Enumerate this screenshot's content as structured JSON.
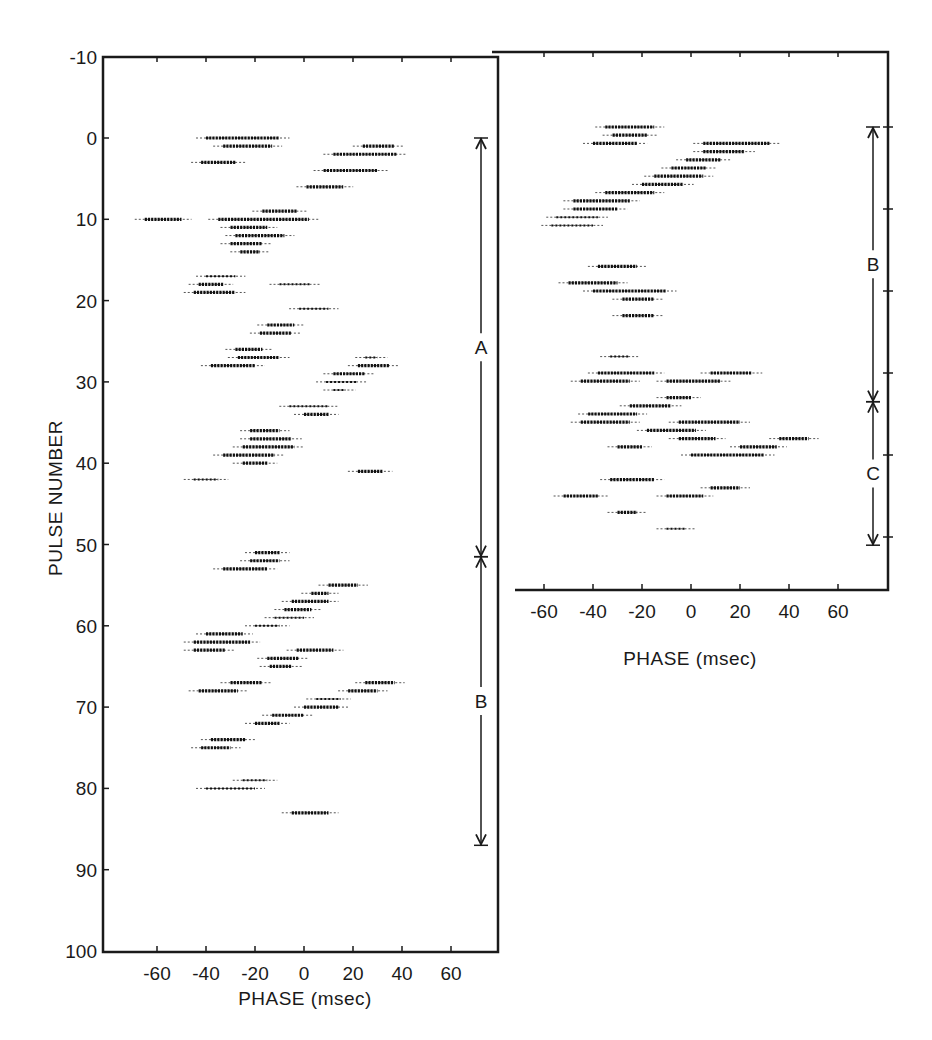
{
  "figure": {
    "left_panel": {
      "ylabel": "PULSE NUMBER",
      "xlabel": "PHASE (msec)",
      "y_ticks": [
        "-10",
        "0",
        "10",
        "20",
        "30",
        "40",
        "50",
        "60",
        "70",
        "80",
        "90",
        "100"
      ],
      "x_ticks": [
        "-60",
        "-40",
        "-20",
        "0",
        "20",
        "40",
        "60"
      ],
      "segments": [
        {
          "label": "A",
          "from": 0,
          "to": 51.5
        },
        {
          "label": "B",
          "from": 51.5,
          "to": 87
        }
      ]
    },
    "right_panel": {
      "xlabel": "PHASE (msec)",
      "x_ticks": [
        "-60",
        "-40",
        "-20",
        "0",
        "20",
        "40",
        "60"
      ],
      "segments": [
        {
          "label": "B",
          "from": 0,
          "to": 33.5
        },
        {
          "label": "C",
          "from": 33.5,
          "to": 51
        }
      ]
    }
  },
  "chart_data": [
    {
      "type": "scatter",
      "title": "",
      "xlabel": "PHASE (msec)",
      "ylabel": "PULSE NUMBER",
      "xlim": [
        -78,
        80
      ],
      "ylim": [
        100,
        -10
      ],
      "grid": false,
      "description": "Pulse-stack character plot showing drifting subpulse bands; each row is a pulse, dark runs mark emission intensity",
      "segments": [
        {
          "label": "A",
          "start": 0,
          "end": 51.5
        },
        {
          "label": "B",
          "start": 51.5,
          "end": 87
        }
      ],
      "bands": [
        {
          "pulse": 0,
          "x_start": -40,
          "x_end": -10,
          "intensity": "strong"
        },
        {
          "pulse": 1,
          "x_start": -33,
          "x_end": -13,
          "intensity": "strong"
        },
        {
          "pulse": 1,
          "x_start": 24,
          "x_end": 37,
          "intensity": "strong"
        },
        {
          "pulse": 2,
          "x_start": 12,
          "x_end": 38,
          "intensity": "strong"
        },
        {
          "pulse": 3,
          "x_start": -42,
          "x_end": -28,
          "intensity": "strong"
        },
        {
          "pulse": 4,
          "x_start": 8,
          "x_end": 30,
          "intensity": "strong"
        },
        {
          "pulse": 6,
          "x_start": 1,
          "x_end": 16,
          "intensity": "strong"
        },
        {
          "pulse": 9,
          "x_start": -17,
          "x_end": -3,
          "intensity": "strong"
        },
        {
          "pulse": 10,
          "x_start": -65,
          "x_end": -50,
          "intensity": "strong"
        },
        {
          "pulse": 10,
          "x_start": -35,
          "x_end": 2,
          "intensity": "strong"
        },
        {
          "pulse": 11,
          "x_start": -30,
          "x_end": -15,
          "intensity": "strong"
        },
        {
          "pulse": 12,
          "x_start": -28,
          "x_end": -8,
          "intensity": "strong"
        },
        {
          "pulse": 13,
          "x_start": -30,
          "x_end": -17,
          "intensity": "strong"
        },
        {
          "pulse": 14,
          "x_start": -26,
          "x_end": -18,
          "intensity": "strong"
        },
        {
          "pulse": 17,
          "x_start": -40,
          "x_end": -28,
          "intensity": "medium"
        },
        {
          "pulse": 18,
          "x_start": -43,
          "x_end": -33,
          "intensity": "strong"
        },
        {
          "pulse": 18,
          "x_start": -10,
          "x_end": 3,
          "intensity": "medium"
        },
        {
          "pulse": 19,
          "x_start": -45,
          "x_end": -28,
          "intensity": "strong"
        },
        {
          "pulse": 21,
          "x_start": -2,
          "x_end": 10,
          "intensity": "medium"
        },
        {
          "pulse": 23,
          "x_start": -15,
          "x_end": -4,
          "intensity": "strong"
        },
        {
          "pulse": 24,
          "x_start": -18,
          "x_end": -5,
          "intensity": "strong"
        },
        {
          "pulse": 26,
          "x_start": -28,
          "x_end": -17,
          "intensity": "strong"
        },
        {
          "pulse": 27,
          "x_start": -27,
          "x_end": -10,
          "intensity": "strong"
        },
        {
          "pulse": 27,
          "x_start": 25,
          "x_end": 30,
          "intensity": "medium"
        },
        {
          "pulse": 28,
          "x_start": -38,
          "x_end": -20,
          "intensity": "strong"
        },
        {
          "pulse": 28,
          "x_start": 22,
          "x_end": 35,
          "intensity": "strong"
        },
        {
          "pulse": 29,
          "x_start": 12,
          "x_end": 25,
          "intensity": "strong"
        },
        {
          "pulse": 30,
          "x_start": 9,
          "x_end": 22,
          "intensity": "medium"
        },
        {
          "pulse": 31,
          "x_start": 12,
          "x_end": 17,
          "intensity": "medium"
        },
        {
          "pulse": 33,
          "x_start": -6,
          "x_end": 10,
          "intensity": "medium"
        },
        {
          "pulse": 34,
          "x_start": 0,
          "x_end": 10,
          "intensity": "strong"
        },
        {
          "pulse": 36,
          "x_start": -22,
          "x_end": -10,
          "intensity": "strong"
        },
        {
          "pulse": 37,
          "x_start": -22,
          "x_end": -5,
          "intensity": "strong"
        },
        {
          "pulse": 38,
          "x_start": -25,
          "x_end": -4,
          "intensity": "strong"
        },
        {
          "pulse": 39,
          "x_start": -33,
          "x_end": -12,
          "intensity": "strong"
        },
        {
          "pulse": 40,
          "x_start": -25,
          "x_end": -15,
          "intensity": "strong"
        },
        {
          "pulse": 41,
          "x_start": 22,
          "x_end": 32,
          "intensity": "strong"
        },
        {
          "pulse": 42,
          "x_start": -45,
          "x_end": -35,
          "intensity": "medium"
        },
        {
          "pulse": 51,
          "x_start": -20,
          "x_end": -10,
          "intensity": "strong"
        },
        {
          "pulse": 52,
          "x_start": -22,
          "x_end": -10,
          "intensity": "strong"
        },
        {
          "pulse": 53,
          "x_start": -33,
          "x_end": -15,
          "intensity": "strong"
        },
        {
          "pulse": 55,
          "x_start": 10,
          "x_end": 22,
          "intensity": "strong"
        },
        {
          "pulse": 56,
          "x_start": 3,
          "x_end": 10,
          "intensity": "strong"
        },
        {
          "pulse": 57,
          "x_start": -5,
          "x_end": 10,
          "intensity": "strong"
        },
        {
          "pulse": 58,
          "x_start": -8,
          "x_end": 3,
          "intensity": "strong"
        },
        {
          "pulse": 59,
          "x_start": -12,
          "x_end": 0,
          "intensity": "medium"
        },
        {
          "pulse": 60,
          "x_start": -20,
          "x_end": -10,
          "intensity": "medium"
        },
        {
          "pulse": 61,
          "x_start": -40,
          "x_end": -25,
          "intensity": "strong"
        },
        {
          "pulse": 62,
          "x_start": -45,
          "x_end": -22,
          "intensity": "strong"
        },
        {
          "pulse": 63,
          "x_start": -45,
          "x_end": -32,
          "intensity": "strong"
        },
        {
          "pulse": 63,
          "x_start": -3,
          "x_end": 12,
          "intensity": "strong"
        },
        {
          "pulse": 64,
          "x_start": -15,
          "x_end": -2,
          "intensity": "strong"
        },
        {
          "pulse": 65,
          "x_start": -14,
          "x_end": -5,
          "intensity": "strong"
        },
        {
          "pulse": 67,
          "x_start": -30,
          "x_end": -17,
          "intensity": "strong"
        },
        {
          "pulse": 67,
          "x_start": 25,
          "x_end": 37,
          "intensity": "strong"
        },
        {
          "pulse": 68,
          "x_start": -43,
          "x_end": -27,
          "intensity": "strong"
        },
        {
          "pulse": 68,
          "x_start": 18,
          "x_end": 30,
          "intensity": "strong"
        },
        {
          "pulse": 69,
          "x_start": 5,
          "x_end": 15,
          "intensity": "medium"
        },
        {
          "pulse": 70,
          "x_start": 0,
          "x_end": 14,
          "intensity": "strong"
        },
        {
          "pulse": 71,
          "x_start": -13,
          "x_end": 0,
          "intensity": "strong"
        },
        {
          "pulse": 72,
          "x_start": -20,
          "x_end": -10,
          "intensity": "strong"
        },
        {
          "pulse": 74,
          "x_start": -38,
          "x_end": -24,
          "intensity": "strong"
        },
        {
          "pulse": 75,
          "x_start": -42,
          "x_end": -30,
          "intensity": "strong"
        },
        {
          "pulse": 79,
          "x_start": -25,
          "x_end": -15,
          "intensity": "medium"
        },
        {
          "pulse": 80,
          "x_start": -40,
          "x_end": -20,
          "intensity": "medium"
        },
        {
          "pulse": 83,
          "x_start": -5,
          "x_end": 10,
          "intensity": "strong"
        }
      ]
    },
    {
      "type": "scatter",
      "title": "",
      "xlabel": "PHASE (msec)",
      "ylabel": "PULSE NUMBER",
      "xlim": [
        -78,
        80
      ],
      "ylim": [
        66,
        -9
      ],
      "grid": false,
      "description": "Second pulse sequence; drift bands then a mode change to a non-drifting pattern",
      "segments": [
        {
          "label": "B",
          "start": 0,
          "end": 33.5
        },
        {
          "label": "C",
          "start": 33.5,
          "end": 51
        }
      ],
      "bands": [
        {
          "pulse": 0,
          "x_start": -35,
          "x_end": -15,
          "intensity": "strong"
        },
        {
          "pulse": 1,
          "x_start": -32,
          "x_end": -18,
          "intensity": "strong"
        },
        {
          "pulse": 2,
          "x_start": -40,
          "x_end": -22,
          "intensity": "strong"
        },
        {
          "pulse": 2,
          "x_start": 5,
          "x_end": 32,
          "intensity": "strong"
        },
        {
          "pulse": 3,
          "x_start": 5,
          "x_end": 22,
          "intensity": "strong"
        },
        {
          "pulse": 4,
          "x_start": -2,
          "x_end": 12,
          "intensity": "strong"
        },
        {
          "pulse": 5,
          "x_start": -8,
          "x_end": 6,
          "intensity": "strong"
        },
        {
          "pulse": 6,
          "x_start": -15,
          "x_end": 5,
          "intensity": "strong"
        },
        {
          "pulse": 7,
          "x_start": -20,
          "x_end": -3,
          "intensity": "strong"
        },
        {
          "pulse": 8,
          "x_start": -35,
          "x_end": -15,
          "intensity": "strong"
        },
        {
          "pulse": 9,
          "x_start": -48,
          "x_end": -25,
          "intensity": "strong"
        },
        {
          "pulse": 10,
          "x_start": -48,
          "x_end": -30,
          "intensity": "strong"
        },
        {
          "pulse": 11,
          "x_start": -55,
          "x_end": -38,
          "intensity": "medium"
        },
        {
          "pulse": 12,
          "x_start": -57,
          "x_end": -40,
          "intensity": "medium"
        },
        {
          "pulse": 17,
          "x_start": -38,
          "x_end": -22,
          "intensity": "strong"
        },
        {
          "pulse": 19,
          "x_start": -50,
          "x_end": -30,
          "intensity": "strong"
        },
        {
          "pulse": 20,
          "x_start": -40,
          "x_end": -10,
          "intensity": "strong"
        },
        {
          "pulse": 21,
          "x_start": -28,
          "x_end": -15,
          "intensity": "strong"
        },
        {
          "pulse": 23,
          "x_start": -28,
          "x_end": -15,
          "intensity": "strong"
        },
        {
          "pulse": 28,
          "x_start": -33,
          "x_end": -25,
          "intensity": "medium"
        },
        {
          "pulse": 30,
          "x_start": -38,
          "x_end": -15,
          "intensity": "strong"
        },
        {
          "pulse": 30,
          "x_start": 8,
          "x_end": 25,
          "intensity": "strong"
        },
        {
          "pulse": 31,
          "x_start": -45,
          "x_end": -25,
          "intensity": "strong"
        },
        {
          "pulse": 31,
          "x_start": -10,
          "x_end": 12,
          "intensity": "strong"
        },
        {
          "pulse": 33,
          "x_start": -10,
          "x_end": 0,
          "intensity": "strong"
        },
        {
          "pulse": 34,
          "x_start": -25,
          "x_end": -8,
          "intensity": "strong"
        },
        {
          "pulse": 35,
          "x_start": -42,
          "x_end": -22,
          "intensity": "strong"
        },
        {
          "pulse": 36,
          "x_start": -45,
          "x_end": -25,
          "intensity": "strong"
        },
        {
          "pulse": 36,
          "x_start": -5,
          "x_end": 20,
          "intensity": "strong"
        },
        {
          "pulse": 37,
          "x_start": -18,
          "x_end": 2,
          "intensity": "strong"
        },
        {
          "pulse": 38,
          "x_start": -5,
          "x_end": 10,
          "intensity": "strong"
        },
        {
          "pulse": 38,
          "x_start": 36,
          "x_end": 48,
          "intensity": "strong"
        },
        {
          "pulse": 39,
          "x_start": -30,
          "x_end": -20,
          "intensity": "strong"
        },
        {
          "pulse": 39,
          "x_start": 20,
          "x_end": 35,
          "intensity": "strong"
        },
        {
          "pulse": 40,
          "x_start": 0,
          "x_end": 30,
          "intensity": "strong"
        },
        {
          "pulse": 43,
          "x_start": -33,
          "x_end": -15,
          "intensity": "strong"
        },
        {
          "pulse": 44,
          "x_start": 8,
          "x_end": 20,
          "intensity": "strong"
        },
        {
          "pulse": 45,
          "x_start": -52,
          "x_end": -38,
          "intensity": "strong"
        },
        {
          "pulse": 45,
          "x_start": -10,
          "x_end": 5,
          "intensity": "strong"
        },
        {
          "pulse": 47,
          "x_start": -30,
          "x_end": -22,
          "intensity": "strong"
        },
        {
          "pulse": 49,
          "x_start": -10,
          "x_end": -2,
          "intensity": "medium"
        }
      ]
    }
  ]
}
